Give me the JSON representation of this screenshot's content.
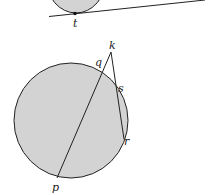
{
  "figure": {
    "fill_color": "#d3d3d3",
    "stroke_color": "#222222",
    "top_diagram": {
      "description": "Circle tangent to a line at point t",
      "points": {
        "t": "t"
      }
    },
    "bottom_diagram": {
      "description": "Circle with secant from k through q to p and secant from k through s to r",
      "points": {
        "k": "k",
        "q": "q",
        "s": "s",
        "r": "r",
        "p": "p"
      }
    }
  }
}
